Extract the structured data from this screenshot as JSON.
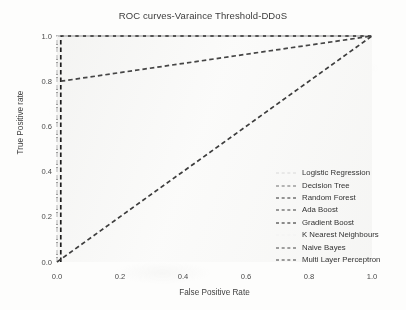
{
  "chart_data": {
    "type": "line",
    "title": "ROC curves-Varaince Threshold-DDoS",
    "xlabel": "False Positive Rate",
    "ylabel": "True Positive rate",
    "xlim": [
      0.0,
      1.0
    ],
    "ylim": [
      0.0,
      1.0
    ],
    "xticks": [
      "0.0",
      "0.2",
      "0.4",
      "0.6",
      "0.8",
      "1.0"
    ],
    "xtick_values": [
      0.0,
      0.2,
      0.4,
      0.6,
      0.8,
      1.0
    ],
    "yticks": [
      "0.0",
      "0.2",
      "0.4",
      "0.6",
      "0.8",
      "1.0"
    ],
    "ytick_values": [
      0.0,
      0.2,
      0.4,
      0.6,
      0.8,
      1.0
    ],
    "grid": false,
    "legend_position": "center right",
    "linestyle": "dashed",
    "series": [
      {
        "name": "Logistic Regression",
        "color": "#d8d8d8",
        "x": [
          0.0,
          0.0,
          1.0
        ],
        "y": [
          0.0,
          1.0,
          1.0
        ]
      },
      {
        "name": "Decision Tree",
        "color": "#6f6f6f",
        "x": [
          0.0,
          0.0,
          1.0
        ],
        "y": [
          0.0,
          1.0,
          1.0
        ]
      },
      {
        "name": "Random Forest",
        "color": "#2e2e2e",
        "x": [
          0.0,
          0.0,
          1.0
        ],
        "y": [
          0.0,
          1.0,
          1.0
        ]
      },
      {
        "name": "Ada Boost",
        "color": "#3a3a3a",
        "x": [
          0.0,
          0.0,
          1.0
        ],
        "y": [
          0.0,
          1.0,
          1.0
        ]
      },
      {
        "name": "Gradient Boost",
        "color": "#1c1c1c",
        "x": [
          0.012,
          0.012,
          1.0
        ],
        "y": [
          0.0,
          1.0,
          1.0
        ]
      },
      {
        "name": "K Nearest Neighbours",
        "color": "#f2f2f2",
        "x": [
          0.0,
          0.0,
          1.0
        ],
        "y": [
          0.0,
          1.0,
          1.0
        ]
      },
      {
        "name": "Naive Bayes",
        "color": "#454545",
        "x": [
          0.012,
          1.0
        ],
        "y": [
          0.8,
          1.0
        ]
      },
      {
        "name": "Multi Layer Perceptron",
        "color": "#3d3d3d",
        "x": [
          0.0,
          1.0
        ],
        "y": [
          0.0,
          1.0
        ]
      }
    ]
  }
}
